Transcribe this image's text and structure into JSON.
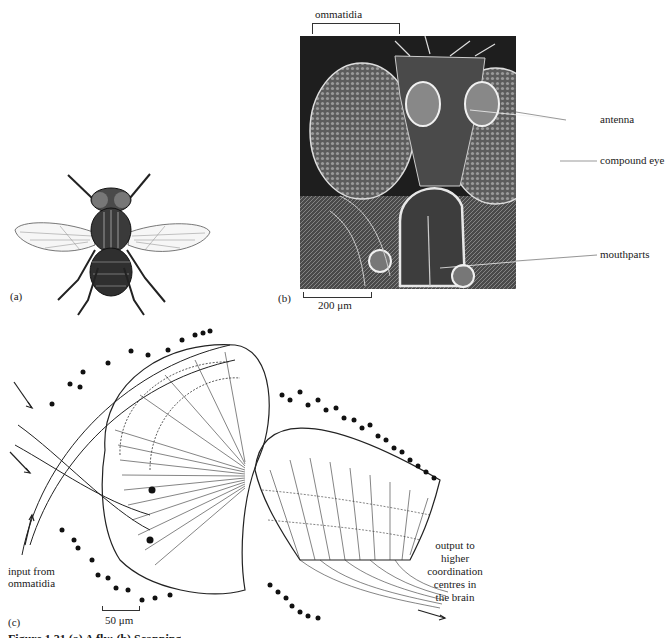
{
  "figure": {
    "panels": {
      "a": {
        "tag": "(a)",
        "subject": "fly-illustration"
      },
      "b": {
        "tag": "(b)",
        "subject": "scanning-electron-micrograph-fly-head",
        "top_bracket_label": "ommatidia",
        "labels": [
          "antenna",
          "compound eye",
          "mouthparts"
        ],
        "scale_bar": "200 μm"
      },
      "c": {
        "tag": "(c)",
        "subject": "neural-layers-optic-lobe",
        "input_label_lines": [
          "input from",
          "ommatidia"
        ],
        "output_label_lines": [
          "output to",
          "higher",
          "coordination",
          "centres in",
          "the brain"
        ],
        "scale_bar": "50 μm"
      }
    },
    "caption_partial": "Figure 1.21  (a) A fly; (b) Scanning"
  },
  "colors": {
    "ink": "#1a1a1a",
    "sem_dark": "#2a2a2a",
    "sem_mid": "#6e6e6e",
    "sem_light": "#e6e6e6",
    "paper": "#ffffff"
  }
}
